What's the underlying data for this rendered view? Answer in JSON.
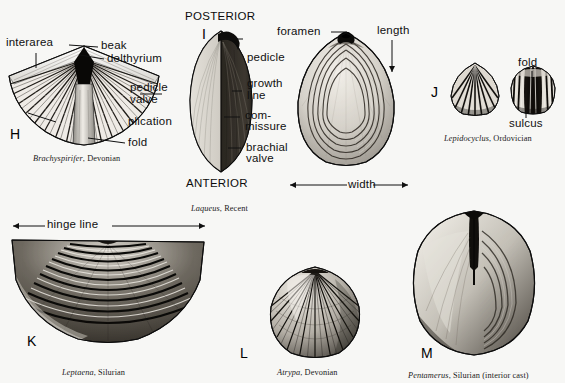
{
  "figure": {
    "background_color": "#f7f7f5",
    "ink_color": "#101010",
    "specimens": [
      {
        "letter": "H",
        "caption_genus": "Brachyspirifer",
        "caption_age": ", Devonian",
        "view": "pedicle valve exterior, spiriferid fan shape",
        "labels": [
          "interarea",
          "beak",
          "delthyrium",
          "pedicle valve",
          "plication",
          "fold"
        ]
      },
      {
        "letter": "I",
        "caption_genus": "Laqueus",
        "caption_age": ", Recent",
        "view": "lateral (side) view, terebratulid",
        "labels": [
          "pedicle",
          "growth line",
          "commissure",
          "brachial valve"
        ],
        "orientation": [
          "POSTERIOR",
          "ANTERIOR"
        ]
      },
      {
        "letter": "",
        "caption_genus": "",
        "caption_age": "",
        "view": "Laqueus dorsal view with dimension arrows",
        "labels": [
          "foramen",
          "length",
          "width"
        ]
      },
      {
        "letter": "J",
        "caption_genus": "Lepidocyclus",
        "caption_age": ", Ordovician",
        "view": "two valves, rhynchonellid",
        "labels": [
          "fold",
          "sulcus"
        ]
      },
      {
        "letter": "K",
        "caption_genus": "Leptaena",
        "caption_age": ", Silurian",
        "view": "strophomenid with wide hinge",
        "labels": [
          "hinge line"
        ]
      },
      {
        "letter": "L",
        "caption_genus": "Atrypa",
        "caption_age": ", Devonian",
        "view": "atrypid, radially ribbed",
        "labels": []
      },
      {
        "letter": "M",
        "caption_genus": "Pentamerus",
        "caption_age": ", Silurian (interior cast)",
        "view": "pentamerid interior cast",
        "labels": []
      }
    ],
    "text": {
      "interarea": "interarea",
      "beak": "beak",
      "delthyrium": "delthyrium",
      "pedicle_valve": "pedicle",
      "pedicle_valve2": "valve",
      "plication": "plication",
      "fold": "fold",
      "posterior": "POSTERIOR",
      "anterior": "ANTERIOR",
      "pedicle": "pedicle",
      "growth": "growth",
      "line": "line",
      "com": "com-",
      "missure": "missure",
      "brachial": "brachial",
      "valve": "valve",
      "foramen": "foramen",
      "length": "length",
      "width": "width",
      "fold_j": "fold",
      "sulcus": "sulcus",
      "hinge_line": "hinge line",
      "letter_h": "H",
      "letter_i": "I",
      "letter_j": "J",
      "letter_k": "K",
      "letter_l": "L",
      "letter_m": "M",
      "cap_h_genus": "Brachyspirifer",
      "cap_h_age": ", Devonian",
      "cap_i_genus": "Laqueus",
      "cap_i_age": ", Recent",
      "cap_j_genus": "Lepidocyclus",
      "cap_j_age": ", Ordovician",
      "cap_k_genus": "Leptaena",
      "cap_k_age": ", Silurian",
      "cap_l_genus": "Atrypa",
      "cap_l_age": ", Devonian",
      "cap_m_genus": "Pentamerus",
      "cap_m_age": ", Silurian (interior cast)"
    }
  }
}
